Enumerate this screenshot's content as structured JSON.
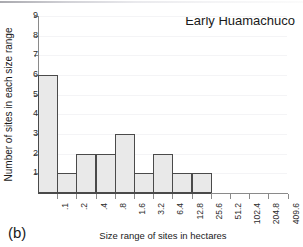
{
  "figure": {
    "panel_label": "(b)",
    "title": "Early Huamachuco"
  },
  "chart_data": {
    "type": "bar",
    "title": "Early Huamachuco",
    "xlabel": "Size range of sites in hectares",
    "ylabel": "Number of sites in each size range",
    "categories": [
      ".1",
      ".2",
      ".4",
      ".8",
      "1.6",
      "3.2",
      "6.4",
      "12.8",
      "25.6",
      "51.2",
      "102.4",
      "204.8",
      "409.6"
    ],
    "values": [
      6,
      1,
      2,
      2,
      3,
      1,
      2,
      1,
      1,
      0,
      0,
      0,
      0
    ],
    "ylim": [
      0,
      9
    ],
    "ytick_labels": [
      "1",
      "2",
      "3",
      "4",
      "5",
      "6",
      "7",
      "8",
      "9"
    ],
    "yticks": [
      1,
      2,
      3,
      4,
      5,
      6,
      7,
      8,
      9
    ],
    "grid": true,
    "legend": "none",
    "bar_fill_color": "#e9e9e9",
    "bar_edge_color": "#4a4a4a",
    "axis_color": "#8a8a8a",
    "text_color": "#1a1a1a",
    "note": "Histogram of site sizes on a doubling (log2) scale; bins beyond 25.6 hectares are empty."
  }
}
